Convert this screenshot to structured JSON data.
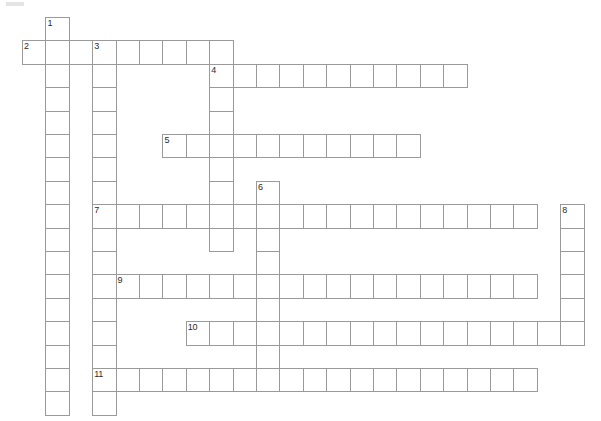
{
  "page": {
    "background_color": "#ffffff",
    "width": 601,
    "height": 421
  },
  "grid": {
    "cell_size": 23.4,
    "origin_x": 22,
    "origin_y": 17,
    "line_color": "#9a9a9a",
    "cell_fill": "#ffffff",
    "number_color": "#2b2b2b",
    "columns": 25,
    "rows": 17
  },
  "entries": [
    {
      "number": 1,
      "direction": "down",
      "col": 1,
      "row": 0,
      "length": 17
    },
    {
      "number": 2,
      "direction": "across",
      "col": 0,
      "row": 1,
      "length": 9
    },
    {
      "number": 3,
      "direction": "down",
      "col": 3,
      "row": 1,
      "length": 16
    },
    {
      "number": 4,
      "direction": "across",
      "col": 8,
      "row": 2,
      "length": 11
    },
    {
      "number": 4,
      "direction": "down",
      "col": 8,
      "row": 2,
      "length": 9
    },
    {
      "number": 5,
      "direction": "across",
      "col": 6,
      "row": 5,
      "length": 11
    },
    {
      "number": 6,
      "direction": "down",
      "col": 10,
      "row": 7,
      "length": 10
    },
    {
      "number": 7,
      "direction": "across",
      "col": 3,
      "row": 8,
      "length": 19
    },
    {
      "number": 8,
      "direction": "down",
      "col": 23,
      "row": 8,
      "length": 6
    },
    {
      "number": 9,
      "direction": "across",
      "col": 4,
      "row": 11,
      "length": 18
    },
    {
      "number": 10,
      "direction": "across",
      "col": 7,
      "row": 13,
      "length": 17
    },
    {
      "number": 11,
      "direction": "across",
      "col": 3,
      "row": 15,
      "length": 19
    }
  ],
  "cells": [
    {
      "col": 1,
      "row": 0,
      "number": "1"
    },
    {
      "col": 0,
      "row": 1,
      "number": "2"
    },
    {
      "col": 1,
      "row": 1,
      "number": ""
    },
    {
      "col": 2,
      "row": 1,
      "number": ""
    },
    {
      "col": 3,
      "row": 1,
      "number": "3"
    },
    {
      "col": 4,
      "row": 1,
      "number": ""
    },
    {
      "col": 5,
      "row": 1,
      "number": ""
    },
    {
      "col": 6,
      "row": 1,
      "number": ""
    },
    {
      "col": 7,
      "row": 1,
      "number": ""
    },
    {
      "col": 8,
      "row": 1,
      "number": ""
    },
    {
      "col": 1,
      "row": 2,
      "number": ""
    },
    {
      "col": 3,
      "row": 2,
      "number": ""
    },
    {
      "col": 8,
      "row": 2,
      "number": "4"
    },
    {
      "col": 9,
      "row": 2,
      "number": ""
    },
    {
      "col": 10,
      "row": 2,
      "number": ""
    },
    {
      "col": 11,
      "row": 2,
      "number": ""
    },
    {
      "col": 12,
      "row": 2,
      "number": ""
    },
    {
      "col": 13,
      "row": 2,
      "number": ""
    },
    {
      "col": 14,
      "row": 2,
      "number": ""
    },
    {
      "col": 15,
      "row": 2,
      "number": ""
    },
    {
      "col": 16,
      "row": 2,
      "number": ""
    },
    {
      "col": 17,
      "row": 2,
      "number": ""
    },
    {
      "col": 18,
      "row": 2,
      "number": ""
    },
    {
      "col": 1,
      "row": 3,
      "number": ""
    },
    {
      "col": 3,
      "row": 3,
      "number": ""
    },
    {
      "col": 8,
      "row": 3,
      "number": ""
    },
    {
      "col": 1,
      "row": 4,
      "number": ""
    },
    {
      "col": 3,
      "row": 4,
      "number": ""
    },
    {
      "col": 8,
      "row": 4,
      "number": ""
    },
    {
      "col": 1,
      "row": 5,
      "number": ""
    },
    {
      "col": 3,
      "row": 5,
      "number": ""
    },
    {
      "col": 6,
      "row": 5,
      "number": "5"
    },
    {
      "col": 7,
      "row": 5,
      "number": ""
    },
    {
      "col": 8,
      "row": 5,
      "number": ""
    },
    {
      "col": 9,
      "row": 5,
      "number": ""
    },
    {
      "col": 10,
      "row": 5,
      "number": ""
    },
    {
      "col": 11,
      "row": 5,
      "number": ""
    },
    {
      "col": 12,
      "row": 5,
      "number": ""
    },
    {
      "col": 13,
      "row": 5,
      "number": ""
    },
    {
      "col": 14,
      "row": 5,
      "number": ""
    },
    {
      "col": 15,
      "row": 5,
      "number": ""
    },
    {
      "col": 16,
      "row": 5,
      "number": ""
    },
    {
      "col": 1,
      "row": 6,
      "number": ""
    },
    {
      "col": 3,
      "row": 6,
      "number": ""
    },
    {
      "col": 8,
      "row": 6,
      "number": ""
    },
    {
      "col": 1,
      "row": 7,
      "number": ""
    },
    {
      "col": 3,
      "row": 7,
      "number": ""
    },
    {
      "col": 8,
      "row": 7,
      "number": ""
    },
    {
      "col": 10,
      "row": 7,
      "number": "6"
    },
    {
      "col": 1,
      "row": 8,
      "number": ""
    },
    {
      "col": 3,
      "row": 8,
      "number": "7"
    },
    {
      "col": 4,
      "row": 8,
      "number": ""
    },
    {
      "col": 5,
      "row": 8,
      "number": ""
    },
    {
      "col": 6,
      "row": 8,
      "number": ""
    },
    {
      "col": 7,
      "row": 8,
      "number": ""
    },
    {
      "col": 8,
      "row": 8,
      "number": ""
    },
    {
      "col": 9,
      "row": 8,
      "number": ""
    },
    {
      "col": 10,
      "row": 8,
      "number": ""
    },
    {
      "col": 11,
      "row": 8,
      "number": ""
    },
    {
      "col": 12,
      "row": 8,
      "number": ""
    },
    {
      "col": 13,
      "row": 8,
      "number": ""
    },
    {
      "col": 14,
      "row": 8,
      "number": ""
    },
    {
      "col": 15,
      "row": 8,
      "number": ""
    },
    {
      "col": 16,
      "row": 8,
      "number": ""
    },
    {
      "col": 17,
      "row": 8,
      "number": ""
    },
    {
      "col": 18,
      "row": 8,
      "number": ""
    },
    {
      "col": 19,
      "row": 8,
      "number": ""
    },
    {
      "col": 20,
      "row": 8,
      "number": ""
    },
    {
      "col": 21,
      "row": 8,
      "number": ""
    },
    {
      "col": 23,
      "row": 8,
      "number": "8"
    },
    {
      "col": 1,
      "row": 9,
      "number": ""
    },
    {
      "col": 3,
      "row": 9,
      "number": ""
    },
    {
      "col": 8,
      "row": 9,
      "number": ""
    },
    {
      "col": 10,
      "row": 9,
      "number": ""
    },
    {
      "col": 23,
      "row": 9,
      "number": ""
    },
    {
      "col": 1,
      "row": 10,
      "number": ""
    },
    {
      "col": 3,
      "row": 10,
      "number": ""
    },
    {
      "col": 10,
      "row": 10,
      "number": ""
    },
    {
      "col": 23,
      "row": 10,
      "number": ""
    },
    {
      "col": 1,
      "row": 11,
      "number": ""
    },
    {
      "col": 3,
      "row": 11,
      "number": ""
    },
    {
      "col": 4,
      "row": 11,
      "number": "9"
    },
    {
      "col": 5,
      "row": 11,
      "number": ""
    },
    {
      "col": 6,
      "row": 11,
      "number": ""
    },
    {
      "col": 7,
      "row": 11,
      "number": ""
    },
    {
      "col": 8,
      "row": 11,
      "number": ""
    },
    {
      "col": 9,
      "row": 11,
      "number": ""
    },
    {
      "col": 10,
      "row": 11,
      "number": ""
    },
    {
      "col": 11,
      "row": 11,
      "number": ""
    },
    {
      "col": 12,
      "row": 11,
      "number": ""
    },
    {
      "col": 13,
      "row": 11,
      "number": ""
    },
    {
      "col": 14,
      "row": 11,
      "number": ""
    },
    {
      "col": 15,
      "row": 11,
      "number": ""
    },
    {
      "col": 16,
      "row": 11,
      "number": ""
    },
    {
      "col": 17,
      "row": 11,
      "number": ""
    },
    {
      "col": 18,
      "row": 11,
      "number": ""
    },
    {
      "col": 19,
      "row": 11,
      "number": ""
    },
    {
      "col": 20,
      "row": 11,
      "number": ""
    },
    {
      "col": 21,
      "row": 11,
      "number": ""
    },
    {
      "col": 23,
      "row": 11,
      "number": ""
    },
    {
      "col": 1,
      "row": 12,
      "number": ""
    },
    {
      "col": 3,
      "row": 12,
      "number": ""
    },
    {
      "col": 10,
      "row": 12,
      "number": ""
    },
    {
      "col": 23,
      "row": 12,
      "number": ""
    },
    {
      "col": 1,
      "row": 13,
      "number": ""
    },
    {
      "col": 3,
      "row": 13,
      "number": ""
    },
    {
      "col": 7,
      "row": 13,
      "number": "10"
    },
    {
      "col": 8,
      "row": 13,
      "number": ""
    },
    {
      "col": 9,
      "row": 13,
      "number": ""
    },
    {
      "col": 10,
      "row": 13,
      "number": ""
    },
    {
      "col": 11,
      "row": 13,
      "number": ""
    },
    {
      "col": 12,
      "row": 13,
      "number": ""
    },
    {
      "col": 13,
      "row": 13,
      "number": ""
    },
    {
      "col": 14,
      "row": 13,
      "number": ""
    },
    {
      "col": 15,
      "row": 13,
      "number": ""
    },
    {
      "col": 16,
      "row": 13,
      "number": ""
    },
    {
      "col": 17,
      "row": 13,
      "number": ""
    },
    {
      "col": 18,
      "row": 13,
      "number": ""
    },
    {
      "col": 19,
      "row": 13,
      "number": ""
    },
    {
      "col": 20,
      "row": 13,
      "number": ""
    },
    {
      "col": 21,
      "row": 13,
      "number": ""
    },
    {
      "col": 22,
      "row": 13,
      "number": ""
    },
    {
      "col": 23,
      "row": 13,
      "number": ""
    },
    {
      "col": 1,
      "row": 14,
      "number": ""
    },
    {
      "col": 3,
      "row": 14,
      "number": ""
    },
    {
      "col": 10,
      "row": 14,
      "number": ""
    },
    {
      "col": 1,
      "row": 15,
      "number": ""
    },
    {
      "col": 3,
      "row": 15,
      "number": "11"
    },
    {
      "col": 4,
      "row": 15,
      "number": ""
    },
    {
      "col": 5,
      "row": 15,
      "number": ""
    },
    {
      "col": 6,
      "row": 15,
      "number": ""
    },
    {
      "col": 7,
      "row": 15,
      "number": ""
    },
    {
      "col": 8,
      "row": 15,
      "number": ""
    },
    {
      "col": 9,
      "row": 15,
      "number": ""
    },
    {
      "col": 10,
      "row": 15,
      "number": ""
    },
    {
      "col": 11,
      "row": 15,
      "number": ""
    },
    {
      "col": 12,
      "row": 15,
      "number": ""
    },
    {
      "col": 13,
      "row": 15,
      "number": ""
    },
    {
      "col": 14,
      "row": 15,
      "number": ""
    },
    {
      "col": 15,
      "row": 15,
      "number": ""
    },
    {
      "col": 16,
      "row": 15,
      "number": ""
    },
    {
      "col": 17,
      "row": 15,
      "number": ""
    },
    {
      "col": 18,
      "row": 15,
      "number": ""
    },
    {
      "col": 19,
      "row": 15,
      "number": ""
    },
    {
      "col": 20,
      "row": 15,
      "number": ""
    },
    {
      "col": 21,
      "row": 15,
      "number": ""
    },
    {
      "col": 1,
      "row": 16,
      "number": ""
    },
    {
      "col": 3,
      "row": 16,
      "number": ""
    }
  ]
}
